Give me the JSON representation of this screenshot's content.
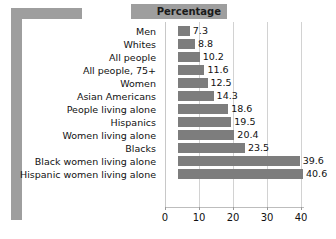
{
  "header": {
    "label": "Percentage"
  },
  "chart_data": {
    "type": "bar",
    "orientation": "horizontal",
    "title": "Percentage",
    "xlabel": "",
    "ylabel": "",
    "xlim": [
      0,
      43
    ],
    "xticks": [
      0,
      10,
      20,
      30,
      40
    ],
    "xtick_labels": [
      "0",
      "10",
      "20",
      "30",
      "40"
    ],
    "grid": true,
    "grid_axis": "x",
    "legend": false,
    "bar_color": "#7d7d7d",
    "value_labels": true,
    "categories": [
      "Men",
      "Whites",
      "All people",
      "All people, 75+",
      "Women",
      "Asian Americans",
      "People living alone",
      "Hispanics",
      "Women living alone",
      "Blacks",
      "Black women living alone",
      "Hispanic women living alone"
    ],
    "values": [
      7.3,
      8.8,
      10.2,
      11.6,
      12.5,
      14.3,
      18.6,
      19.5,
      20.4,
      23.5,
      39.6,
      40.6
    ],
    "value_labels_text": [
      "7.3",
      "8.8",
      "10.2",
      "11.6",
      "12.5",
      "14.3",
      "18.6",
      "19.5",
      "20.4",
      "23.5",
      "39.6",
      "40.6"
    ]
  },
  "colors": {
    "frame": "#9e9e9e",
    "bar": "#7d7d7d",
    "grid": "#d2d2d2",
    "text": "#111111"
  }
}
